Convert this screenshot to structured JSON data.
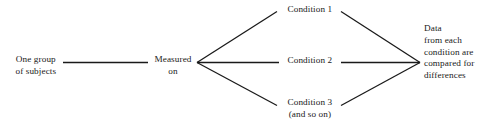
{
  "diagram": {
    "type": "flowchart",
    "background_color": "#ffffff",
    "line_color": "#1a1a1a",
    "text_color": "#1a1a1a",
    "nodes": {
      "one_group": {
        "id": "one-group-of-subjects",
        "lines": [
          "One group",
          "of subjects"
        ]
      },
      "measured": {
        "id": "measured-on",
        "lines": [
          "Measured",
          "on"
        ]
      },
      "condition_1": {
        "id": "condition-1",
        "lines": [
          "Condition 1"
        ]
      },
      "condition_2": {
        "id": "condition-2",
        "lines": [
          "Condition 2"
        ]
      },
      "condition_3": {
        "id": "condition-3",
        "lines": [
          "Condition 3",
          "(and so on)"
        ]
      },
      "data_result": {
        "id": "data-from-each-condition",
        "lines": [
          "Data",
          "from each",
          "condition are",
          "compared for",
          "differences"
        ]
      }
    },
    "connectors": [
      {
        "id": "one-group-to-measured",
        "from": "one_group",
        "to": "measured",
        "shape": "horizontal"
      },
      {
        "id": "measured-to-condition-1",
        "from": "measured",
        "to": "condition_1",
        "shape": "diagonal-up"
      },
      {
        "id": "measured-to-condition-2",
        "from": "measured",
        "to": "condition_2",
        "shape": "horizontal"
      },
      {
        "id": "measured-to-condition-3",
        "from": "measured",
        "to": "condition_3",
        "shape": "diagonal-down"
      },
      {
        "id": "condition-1-to-data",
        "from": "condition_1",
        "to": "data_result",
        "shape": "diagonal-down"
      },
      {
        "id": "condition-2-to-data",
        "from": "condition_2",
        "to": "data_result",
        "shape": "horizontal"
      },
      {
        "id": "condition-3-to-data",
        "from": "condition_3",
        "to": "data_result",
        "shape": "diagonal-up"
      }
    ]
  }
}
